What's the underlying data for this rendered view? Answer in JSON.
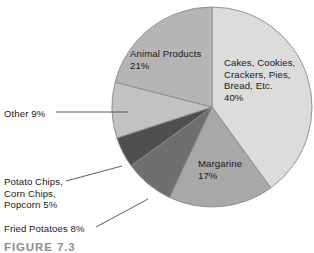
{
  "figure": {
    "caption": "FIGURE 7.3"
  },
  "chart_data": {
    "type": "pie",
    "title": "",
    "subtitle": "",
    "xlabel": "",
    "ylabel": "",
    "legend_position": "none",
    "grid": false,
    "start_angle_deg": 0,
    "direction": "clockwise",
    "center": {
      "x": 212,
      "y": 107
    },
    "radius": 100,
    "total_percent": 100,
    "categories": [
      "Cakes, Cookies, Crackers, Pies, Bread, Etc.",
      "Margarine",
      "Fried Potatoes",
      "Potato Chips, Corn Chips, Popcorn",
      "Other",
      "Animal Products"
    ],
    "values": [
      40,
      17,
      8,
      5,
      9,
      21
    ],
    "colors": [
      "#dcdcdc",
      "#a8a8a8",
      "#6e6e6e",
      "#4f4f4f",
      "#c2c2c2",
      "#b5b5b5"
    ],
    "slices": [
      {
        "name": "cakes-cookies-crackers-pies-bread",
        "label_lines": [
          "Cakes, Cookies,",
          "Crackers, Pies,",
          "Bread, Etc.",
          "40%"
        ],
        "value": 40,
        "color": "#dcdcdc",
        "label_placement": "outside-right",
        "leader": false
      },
      {
        "name": "margarine",
        "label_lines": [
          "Margarine",
          "17%"
        ],
        "value": 17,
        "color": "#a8a8a8",
        "label_placement": "inside",
        "leader": false
      },
      {
        "name": "fried-potatoes",
        "label_lines": [
          "Fried Potatoes 8%"
        ],
        "value": 8,
        "color": "#6e6e6e",
        "label_placement": "outside-left",
        "leader": true
      },
      {
        "name": "potato-chips-corn-chips-popcorn",
        "label_lines": [
          "Potato Chips,",
          "Corn Chips,",
          "Popcorn 5%"
        ],
        "value": 5,
        "color": "#4f4f4f",
        "label_placement": "outside-left",
        "leader": true
      },
      {
        "name": "other",
        "label_lines": [
          "Other 9%"
        ],
        "value": 9,
        "color": "#c2c2c2",
        "label_placement": "outside-left",
        "leader": true
      },
      {
        "name": "animal-products",
        "label_lines": [
          "Animal Products",
          "21%"
        ],
        "value": 21,
        "color": "#b5b5b5",
        "label_placement": "inside",
        "leader": false
      }
    ]
  },
  "labels": {
    "cakes": "Cakes, Cookies,\nCrackers, Pies,\nBread, Etc.\n40%",
    "animal_products": "Animal Products\n21%",
    "margarine": "Margarine\n17%",
    "other": "Other 9%",
    "potato_chips": "Potato Chips,\nCorn Chips,\nPopcorn 5%",
    "fried_potatoes": "Fried Potatoes 8%"
  },
  "style": {
    "slice_outline": "#8a8a8a",
    "leader_line": "#4a4a4a",
    "text_color": "#1a1a1a",
    "caption_color": "#8d8d8d",
    "background": "#ffffff"
  }
}
